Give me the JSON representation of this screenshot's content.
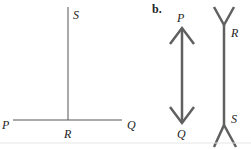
{
  "figure_a": {
    "labels": {
      "S": "S",
      "P": "P",
      "R": "R",
      "Q": "Q"
    }
  },
  "figure_b": {
    "part_label": "b.",
    "labels": {
      "P": "P",
      "Q": "Q",
      "R": "R",
      "S": "S"
    }
  },
  "colors": {
    "line": "#555555",
    "thick_line": "#606060",
    "text": "#222222",
    "divider": "#e6e6e6"
  }
}
